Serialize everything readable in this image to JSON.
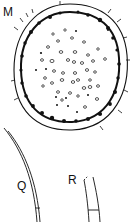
{
  "figure": {
    "panels": [
      {
        "id": "M",
        "label": "M",
        "description": "cross-section oval with dotted interior"
      },
      {
        "id": "Q",
        "label": "Q",
        "description": "curved strand"
      },
      {
        "id": "R",
        "label": "R",
        "description": "tube segment"
      }
    ],
    "colors": {
      "ink": "#111111",
      "background": "#ffffff"
    }
  }
}
